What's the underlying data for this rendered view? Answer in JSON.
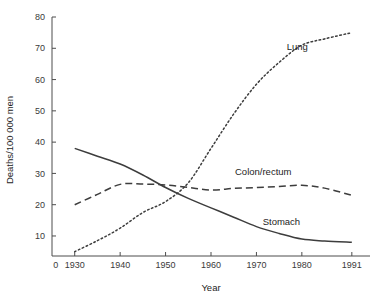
{
  "chart_data": {
    "type": "line",
    "title": "",
    "subtitle": "",
    "xlabel": "Year",
    "ylabel": "Deaths/100 000 men",
    "xlim": [
      1925,
      1995
    ],
    "ylim": [
      3.6,
      80
    ],
    "grid": false,
    "legend_position": "inline-end-of-line",
    "x_ticks": [
      "0",
      "1930",
      "1940",
      "1950",
      "1960",
      "1970",
      "1980",
      "1991"
    ],
    "x_tick_values": [
      1925.8,
      1930,
      1940,
      1950,
      1960,
      1970,
      1980,
      1991
    ],
    "y_ticks": [
      "10",
      "20",
      "30",
      "40",
      "50",
      "60",
      "70",
      "80"
    ],
    "y_tick_values": [
      10,
      20,
      30,
      40,
      50,
      60,
      70,
      80
    ],
    "x": [
      1930,
      1935,
      1940,
      1945,
      1950,
      1955,
      1960,
      1965,
      1970,
      1975,
      1980,
      1985,
      1991
    ],
    "series": [
      {
        "name": "Lung",
        "style": "dotted",
        "color": "#3d3d3d",
        "label": "Lung",
        "label_x": 1979,
        "label_y": 69.5,
        "values": [
          5,
          8.5,
          12.5,
          17.5,
          21,
          27,
          38,
          49,
          58.5,
          65.5,
          71,
          73,
          75
        ]
      },
      {
        "name": "Colon/rectum",
        "style": "dashed",
        "color": "#3d3d3d",
        "label": "Colon/rectum",
        "label_x": 1971.5,
        "label_y": 29.5,
        "values": [
          20,
          23.3,
          26.5,
          26.6,
          26.3,
          25.5,
          24.7,
          25.2,
          25.5,
          25.8,
          26.2,
          25.3,
          23
        ]
      },
      {
        "name": "Stomach",
        "style": "solid",
        "color": "#3d3d3d",
        "label": "Stomach",
        "label_x": 1975.5,
        "label_y": 13.5,
        "values": [
          38,
          35.5,
          33,
          29.5,
          25.5,
          22,
          19,
          16,
          13,
          10.8,
          9,
          8.4,
          8
        ]
      }
    ]
  }
}
